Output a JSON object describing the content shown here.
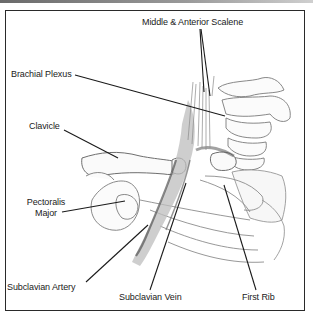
{
  "diagram": {
    "type": "anatomical-illustration",
    "labels": {
      "scalene": "Middle & Anterior Scalene",
      "brachial_plexus": "Brachial Plexus",
      "clavicle": "Clavicle",
      "pectoralis_line1": "Pectoralis",
      "pectoralis_line2": "Major",
      "subclavian_artery": "Subclavian Artery",
      "subclavian_vein": "Subclavian Vein",
      "first_rib": "First Rib"
    },
    "colors": {
      "frame": "#2a2a2a",
      "leader_line": "#1a1a1a",
      "sketch_dark": "#555555",
      "sketch_light": "#9a9a9a",
      "background": "#ffffff"
    }
  }
}
